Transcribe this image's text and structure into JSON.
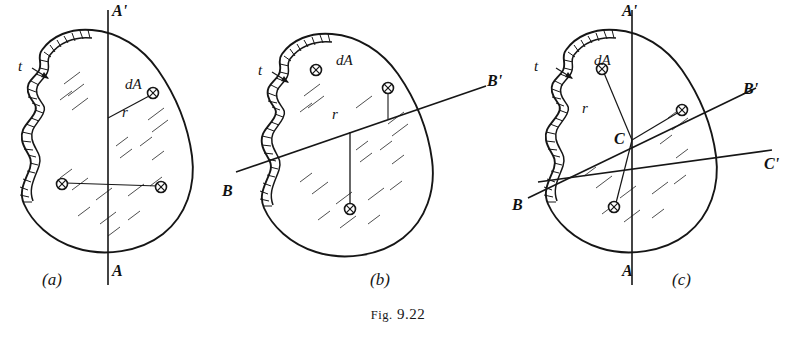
{
  "figure": {
    "caption_prefix": "Fig.",
    "caption_number": "9.22"
  },
  "panels": [
    {
      "id": "a",
      "label": "(a)",
      "axis_labels": [
        {
          "name": "axis-top-label-a",
          "text": "A'"
        },
        {
          "name": "axis-bottom-label-a",
          "text": "A"
        }
      ],
      "annotations": [
        {
          "name": "thickness-label-a",
          "text": "t"
        },
        {
          "name": "area-element-label-a",
          "text": "dA"
        },
        {
          "name": "radius-label-a",
          "text": "r"
        }
      ]
    },
    {
      "id": "b",
      "label": "(b)",
      "axis_labels": [
        {
          "name": "axis-right-label-b",
          "text": "B'"
        },
        {
          "name": "axis-left-label-b",
          "text": "B"
        }
      ],
      "annotations": [
        {
          "name": "thickness-label-b",
          "text": "t"
        },
        {
          "name": "area-element-label-b",
          "text": "dA"
        },
        {
          "name": "radius-label-b",
          "text": "r"
        }
      ]
    },
    {
      "id": "c",
      "label": "(c)",
      "axis_labels": [
        {
          "name": "axis-top-label-c",
          "text": "A'"
        },
        {
          "name": "axis-bottom-label-c",
          "text": "A"
        },
        {
          "name": "axis-right-label-c",
          "text": "B'"
        },
        {
          "name": "axis-left-label-c",
          "text": "B"
        },
        {
          "name": "axis-right2-label-c",
          "text": "C'"
        },
        {
          "name": "centroid-label-c",
          "text": "C"
        }
      ],
      "annotations": [
        {
          "name": "thickness-label-c",
          "text": "t"
        },
        {
          "name": "area-element-label-c",
          "text": "dA"
        },
        {
          "name": "radius-label-c",
          "text": "r"
        }
      ]
    }
  ],
  "colors": {
    "ink": "#161616",
    "paper": "#ffffff"
  }
}
